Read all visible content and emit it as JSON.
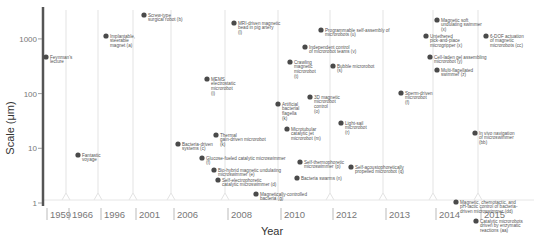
{
  "chart_data": {
    "type": "scatter",
    "title": "",
    "xlabel": "Year",
    "ylabel": "Scale (μm)",
    "y_scale": "log",
    "ylim": [
      0.7,
      3500
    ],
    "y_ticks": [
      {
        "value": 1,
        "label": "1"
      },
      {
        "value": 10,
        "label": "10"
      },
      {
        "value": 100,
        "label": "100"
      },
      {
        "value": 1000,
        "label": "1000"
      }
    ],
    "x_categories": [
      "1959",
      "1966",
      "1996",
      "2001",
      "2006",
      "2008",
      "2010",
      "2012",
      "2013",
      "2014",
      "2015"
    ],
    "grid": false,
    "legend": "none",
    "points": [
      {
        "year": "1959",
        "scale": 480,
        "label": "Feynman's lecture"
      },
      {
        "year": "1966",
        "scale": 6,
        "label": "Fantastic voyage"
      },
      {
        "year": "1996",
        "scale": 1100,
        "label": "Implantable, steerable magnet (a)"
      },
      {
        "year": "2001",
        "scale": 3000,
        "label": "Screw-type surgical robot (b)"
      },
      {
        "year": "2006",
        "scale": 9,
        "label": "Bacteria-driven systems (c)"
      },
      {
        "year": "2006",
        "scale": 150,
        "label": "MEMS electrostatic microrobot (i)"
      },
      {
        "year": "2006",
        "scale": 15,
        "label": "Thermal gain-driven microrobot (k)"
      },
      {
        "year": "2006",
        "scale": 4.5,
        "label": "Glucose-fueled catalytic microswimmer (f)"
      },
      {
        "year": "2006",
        "scale": 2.8,
        "label": "Bio-hybrid magnetic undulating microswimmer (e)"
      },
      {
        "year": "2006",
        "scale": 1.9,
        "label": "Self-electrophoretic catalytic microswimmer (d)"
      },
      {
        "year": "2008",
        "scale": 2000,
        "label": "MRI-driven magnetic bead in pig artery (l)"
      },
      {
        "year": "2008",
        "scale": 60,
        "label": "Artificial bacterial flagella (k)"
      },
      {
        "year": "2008",
        "scale": 1.2,
        "label": "Magnetically-controlled bacteria (g)"
      },
      {
        "year": "2010",
        "scale": 270,
        "label": "Crawling magnetic microrobot (t)"
      },
      {
        "year": "2010",
        "scale": 90,
        "label": "3D magnetic microrobot control (o)"
      },
      {
        "year": "2010",
        "scale": 22,
        "label": "Microtubular catalytic jet microrobot (m)"
      },
      {
        "year": "2010",
        "scale": 3.5,
        "label": "Self-thermophoretic microswimmer (p)"
      },
      {
        "year": "2010",
        "scale": 2.0,
        "label": "Bacteria swarms (n)"
      },
      {
        "year": "2010",
        "scale": 600,
        "label": "Independent control of microrobot teams (v)"
      },
      {
        "year": "2012",
        "scale": 1700,
        "label": "Programmable self-assembly of microrobots (u)"
      },
      {
        "year": "2012",
        "scale": 200,
        "label": "Bubble microrobot (s)"
      },
      {
        "year": "2012",
        "scale": 25,
        "label": "Light-sail microrobot (r)"
      },
      {
        "year": "2012",
        "scale": 3.0,
        "label": "Self-acoustophoretically propelled microrobot (q)"
      },
      {
        "year": "2013",
        "scale": 90,
        "label": "Sperm-driven microrobot (f)"
      },
      {
        "year": "2014",
        "scale": 2500,
        "label": "Magnetic soft undulating swimmer (x)"
      },
      {
        "year": "2014",
        "scale": 1100,
        "label": "Untethered pick-and-place microgripper (x)"
      },
      {
        "year": "2014",
        "scale": 450,
        "label": "Cell-laden gel assembling microrobot (y)"
      },
      {
        "year": "2014",
        "scale": 270,
        "label": "Multi-flagellated swimmer (z)"
      },
      {
        "year": "2014",
        "scale": 2.3,
        "label": "Magnetic, chemotactic, and pH-tactic control of bacteria-driven microswimmer (dd)"
      },
      {
        "year": "2015",
        "scale": 1100,
        "label": "6-DOF actuation of magnetic microrobots (cc)"
      },
      {
        "year": "2015",
        "scale": 15,
        "label": "In vivo navigation of microswimmer (bb)"
      },
      {
        "year": "2015",
        "scale": 1.3,
        "label": "Catalytic microrobots driven by enzymatic reactions (aa)"
      }
    ]
  },
  "layout": {
    "plot_left": 44,
    "plot_right": 534,
    "plot_top": 10,
    "plot_bottom": 203,
    "axis_color": "#555555",
    "point_color": "#4a4a4a",
    "year_columns": [
      {
        "year": "1959",
        "x0": 44,
        "x1": 66,
        "px": 47
      },
      {
        "year": "1966",
        "x0": 66,
        "x1": 98,
        "px": 78
      },
      {
        "year": "1996",
        "x0": 98,
        "x1": 133,
        "px": 106
      },
      {
        "year": "2001",
        "x0": 133,
        "x1": 171,
        "px": 144
      },
      {
        "year": "2006",
        "x0": 171,
        "x1": 225,
        "px": 178
      },
      {
        "year": "2008",
        "x0": 225,
        "x1": 278,
        "px": 232
      },
      {
        "year": "2010",
        "x0": 278,
        "x1": 330,
        "px": 284
      },
      {
        "year": "2012",
        "x0": 330,
        "x1": 383,
        "px": 336
      },
      {
        "year": "2013",
        "x0": 383,
        "x1": 433,
        "px": 389
      },
      {
        "year": "2014",
        "x0": 433,
        "x1": 478,
        "px": 439
      },
      {
        "year": "2015",
        "x0": 478,
        "x1": 534,
        "px": 484
      }
    ]
  },
  "placements": [
    {
      "x": 46,
      "y": 57,
      "lines": [
        "Feynman's",
        "lecture"
      ]
    },
    {
      "x": 78,
      "y": 155,
      "lines": [
        "Fantastic",
        "voyage"
      ]
    },
    {
      "x": 106,
      "y": 36,
      "lines": [
        "Implantable,",
        "steerable",
        "magnet (a)"
      ]
    },
    {
      "x": 144,
      "y": 15,
      "lines": [
        "Screw-type",
        "surgical robot (b)"
      ]
    },
    {
      "x": 178,
      "y": 144,
      "lines": [
        "Bacteria-driven",
        "systems (c)"
      ]
    },
    {
      "x": 207,
      "y": 79,
      "lines": [
        "MEMS",
        "electrostatic",
        "microrobot",
        "(i)"
      ]
    },
    {
      "x": 216,
      "y": 135,
      "lines": [
        "Thermal",
        "gain-driven microrobot",
        "(k)"
      ]
    },
    {
      "x": 202,
      "y": 158,
      "lines": [
        "Glucose-fueled  catalytic  microswimmer",
        "(f)"
      ]
    },
    {
      "x": 214,
      "y": 170,
      "lines": [
        "Bio-hybrid magnetic undulating",
        "microswimmer (e)"
      ]
    },
    {
      "x": 218,
      "y": 180,
      "lines": [
        "Self-electrophoretic",
        "catalytic microswimmer (d)"
      ]
    },
    {
      "x": 234,
      "y": 23,
      "lines": [
        "MRI-driven magnetic",
        "bead in pig artery",
        "(l)"
      ]
    },
    {
      "x": 278,
      "y": 104,
      "lines": [
        "Artificial",
        "bacterial",
        "flagella",
        "(k)"
      ]
    },
    {
      "x": 256,
      "y": 194,
      "lines": [
        "Magnetically-controlled",
        "bacteria (g)"
      ]
    },
    {
      "x": 290,
      "y": 62,
      "lines": [
        "Crawling",
        "magnetic",
        "microrobot",
        "(t)"
      ]
    },
    {
      "x": 310,
      "y": 97,
      "lines": [
        "3D magnetic",
        "microrobot",
        "control",
        "(o)"
      ]
    },
    {
      "x": 287,
      "y": 129,
      "lines": [
        "Microtubular",
        "catalytic jet",
        "microrobot (m)"
      ]
    },
    {
      "x": 300,
      "y": 162,
      "lines": [
        "Self-thermophoretic",
        "microswimmer (p)"
      ]
    },
    {
      "x": 297,
      "y": 178,
      "lines": [
        "Bacteria swarms (n)"
      ]
    },
    {
      "x": 305,
      "y": 47,
      "lines": [
        "Independent control",
        "of microrobot teams (v)"
      ]
    },
    {
      "x": 321,
      "y": 30,
      "lines": [
        "Programmable self-assembly of",
        "microrobots (u)"
      ]
    },
    {
      "x": 333,
      "y": 66,
      "lines": [
        "Bubble microrobot",
        "(s)"
      ]
    },
    {
      "x": 341,
      "y": 123,
      "lines": [
        "Light-sail",
        "microrobot",
        "(r)"
      ]
    },
    {
      "x": 351,
      "y": 167,
      "lines": [
        "Self-acoustophoretically",
        "propelled microrobot (q)"
      ]
    },
    {
      "x": 401,
      "y": 93,
      "lines": [
        "Sperm-driven",
        "microrobot",
        "(f)"
      ]
    },
    {
      "x": 437,
      "y": 20,
      "lines": [
        "Magnetic soft",
        "undulating swimmer",
        "(x)"
      ]
    },
    {
      "x": 426,
      "y": 36,
      "lines": [
        "Untethered",
        "pick-and-place",
        "microgripper (x)"
      ]
    },
    {
      "x": 430,
      "y": 57,
      "lines": [
        "Cell-laden gel assembling",
        "microrobot (y)"
      ]
    },
    {
      "x": 437,
      "y": 70,
      "lines": [
        "Multi-flagellated",
        "swimmer (z)"
      ]
    },
    {
      "x": 456,
      "y": 202,
      "lines": [
        "Magnetic, chemotactic, and",
        "pH-tactic control of bacteria-",
        "driven microswimmer (dd)"
      ]
    },
    {
      "x": 486,
      "y": 36,
      "lines": [
        "6-DOF actuation",
        "of magnetic",
        "microrobots (cc)"
      ]
    },
    {
      "x": 475,
      "y": 133,
      "lines": [
        "In vivo navigation",
        "of microswimmer",
        "(bb)"
      ]
    },
    {
      "x": 476,
      "y": 221,
      "lines": [
        "Catalytic microrobots",
        "driven by enzymatic",
        "reactions (aa)"
      ]
    }
  ]
}
